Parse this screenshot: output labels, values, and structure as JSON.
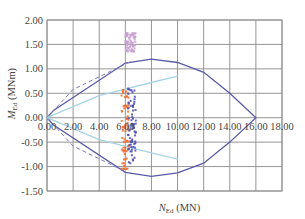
{
  "chart_data": {
    "type": "line",
    "title": "",
    "xlabel": "N_Ed (MN)",
    "ylabel": "M_Ed (MNm)",
    "xlabel_main": "N",
    "xlabel_sub": "Ed",
    "xlabel_unit": " (MN)",
    "ylabel_main": "M",
    "ylabel_sub": "Ed",
    "ylabel_unit": " (MNm)",
    "xlim": [
      0,
      18
    ],
    "ylim": [
      -1.5,
      2.0
    ],
    "grid": true,
    "x_ticks": [
      "0.00",
      "2.00",
      "4.00",
      "6.00",
      "8.00",
      "10.00",
      "12.00",
      "14.00",
      "16.00",
      "18.00"
    ],
    "y_ticks": [
      "2.00",
      "1.50",
      "1.00",
      "0.50",
      "0.00",
      "-0.50",
      "-1.00",
      "-1.50"
    ],
    "series": [
      {
        "name": "Interaction diagram (solid)",
        "style": "solid",
        "color": "#5a5aa8",
        "x": [
          0.0,
          0.5,
          6.0,
          8.0,
          10.0,
          12.0,
          14.0,
          16.0,
          14.0,
          12.0,
          10.0,
          8.0,
          6.0,
          0.5,
          0.0
        ],
        "y": [
          0.0,
          0.15,
          1.12,
          1.2,
          1.13,
          0.93,
          0.5,
          0.0,
          -0.5,
          -0.93,
          -1.13,
          -1.2,
          -1.12,
          -0.15,
          0.0
        ]
      },
      {
        "name": "Interaction diagram (dashed)",
        "style": "dashed",
        "color": "#7a7ab8",
        "x": [
          0.0,
          2.0,
          6.5
        ],
        "y": [
          0.0,
          0.58,
          1.16
        ]
      },
      {
        "name": "Interaction diagram (dashed, lower)",
        "style": "dashed",
        "color": "#7a7ab8",
        "x": [
          0.0,
          2.0,
          6.0
        ],
        "y": [
          0.0,
          -0.58,
          -1.1
        ]
      },
      {
        "name": "Reduced envelope (cyan)",
        "style": "solid",
        "color": "#a8d4e6",
        "x": [
          0.0,
          4.0,
          8.0,
          10.0
        ],
        "y": [
          0.0,
          0.45,
          0.72,
          0.85
        ]
      },
      {
        "name": "Reduced envelope lower (cyan)",
        "style": "solid",
        "color": "#a8d4e6",
        "x": [
          0.0,
          4.0,
          8.0,
          10.0
        ],
        "y": [
          0.0,
          -0.45,
          -0.72,
          -0.85
        ]
      },
      {
        "name": "Load cases (orange)",
        "style": "scatter",
        "color": "#f26a2a",
        "x_range": [
          5.7,
          6.3
        ],
        "y_range": [
          -1.05,
          0.6
        ]
      },
      {
        "name": "Load cases (blue)",
        "style": "scatter",
        "color": "#4a4ab0",
        "x_range": [
          6.2,
          6.8
        ],
        "y_range": [
          -1.0,
          0.6
        ]
      },
      {
        "name": "Load cases (light purple)",
        "style": "scatter",
        "color": "#c8a0d0",
        "x_range": [
          6.0,
          6.8
        ],
        "y_range": [
          1.35,
          1.75
        ]
      }
    ]
  }
}
